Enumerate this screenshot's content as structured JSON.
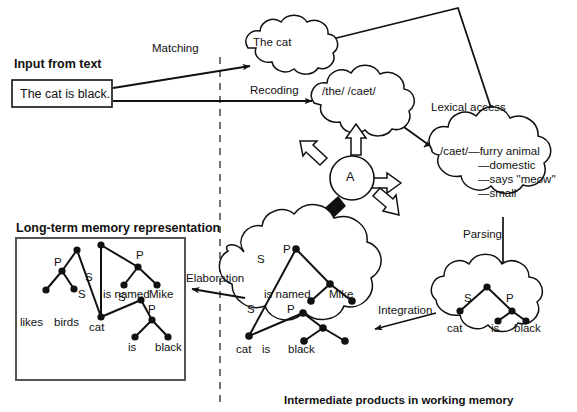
{
  "diagram": {
    "title_hidden": "",
    "caption": "Intermediate products in working memory"
  },
  "input": {
    "heading": "Input from text",
    "sentence": "The cat is black."
  },
  "process_labels": {
    "matching": "Matching",
    "recoding": "Recoding",
    "lexical_access": "Lexical access",
    "parsing": "Parsing",
    "integration": "Integration",
    "elaboration": "Elaboration"
  },
  "clouds": {
    "word_cloud": {
      "text": "The cat"
    },
    "phoneme_cloud": {
      "text": "/the/  /caet/"
    },
    "lexicon_cloud": {
      "entry": "/caet/—furry animal",
      "features": [
        "—domestic",
        "—says ''meow''",
        "—small"
      ]
    },
    "parsed_cloud": {
      "labels": {
        "s": "S",
        "p": "P"
      },
      "terminals": [
        "cat",
        "is",
        "black"
      ]
    },
    "working_cloud": {
      "labels": {
        "s1": "S",
        "p1": "P",
        "s2": "S",
        "p2": "P"
      },
      "terminals_top": [
        "is named",
        "Mike"
      ],
      "terminals_bottom": [
        "cat",
        "is",
        "black"
      ]
    }
  },
  "activation": {
    "node_label": "A"
  },
  "ltm": {
    "heading": "Long-term memory representation",
    "labels": {
      "p_left": "P",
      "s_left": "S",
      "s_up": "S",
      "p_up": "P",
      "s_right": "S",
      "p_right": "P"
    },
    "terminals": [
      "likes birds",
      "cat",
      "is named",
      "Mike",
      "is",
      "black"
    ],
    "terminal_likes": "likes",
    "terminal_birds": "birds"
  },
  "colors": {
    "ink": "#111111",
    "paper": "#ffffff",
    "fill_arrow": "#000000",
    "hollow_arrow": "#ffffff"
  }
}
